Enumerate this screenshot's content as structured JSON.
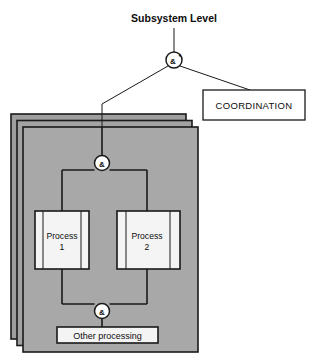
{
  "diagram": {
    "title": "Subsystem Level",
    "background_color": "#ffffff",
    "line_color": "#1a1a1a",
    "card_fill_color": "#a8a8a8",
    "card_fill_color_back": "#9a9a9a",
    "box_fill_color": "#f4f4f4",
    "nodes": {
      "top_gate": {
        "label": "&",
        "marker": "*",
        "type": "and-gate",
        "cx": 174,
        "cy": 60,
        "r": 8
      },
      "middle_gate": {
        "label": "&",
        "type": "and-gate",
        "cx": 102,
        "cy": 163,
        "r": 7.5
      },
      "bottom_gate": {
        "label": "&",
        "type": "and-gate",
        "cx": 102,
        "cy": 311,
        "r": 7.5
      }
    },
    "boxes": {
      "coordination": {
        "label": "COORDINATION",
        "x": 203,
        "y": 90,
        "width": 102,
        "height": 30
      },
      "process_1": {
        "label_line1": "Process",
        "label_line2": "1",
        "x": 35,
        "y": 211,
        "width": 54,
        "height": 58
      },
      "process_2": {
        "label_line1": "Process",
        "label_line2": "2",
        "x": 117,
        "y": 211,
        "width": 63,
        "height": 58
      },
      "other_processing": {
        "label": "Other processing",
        "x": 57,
        "y": 327,
        "width": 101,
        "height": 16
      }
    },
    "stacked_cards": {
      "count": 3,
      "offset_x": 6,
      "offset_y": 6,
      "front": {
        "x": 23,
        "y": 127,
        "width": 175,
        "height": 225
      }
    }
  }
}
